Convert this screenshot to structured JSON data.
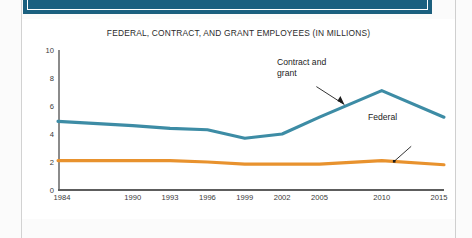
{
  "page": {
    "banner_color": "#1a6080",
    "sheet_color": "#fbfbfb"
  },
  "chart_data": {
    "type": "line",
    "title": "FEDERAL, CONTRACT, AND GRANT EMPLOYEES (IN MILLIONS)",
    "xlabel": "",
    "ylabel": "",
    "ylim": [
      0,
      10
    ],
    "yticks": [
      0,
      2,
      4,
      6,
      8,
      10
    ],
    "ytick_labels": [
      "0",
      "2",
      "4",
      "6",
      "8",
      "10"
    ],
    "x": [
      1984,
      1990,
      1993,
      1996,
      1999,
      2002,
      2005,
      2010,
      2015
    ],
    "xtick_labels": [
      "1984",
      "1990",
      "1993",
      "1996",
      "1999",
      "2002",
      "2005",
      "2010",
      "2015"
    ],
    "xlim": [
      1984,
      2015
    ],
    "grid": false,
    "legend_position": "inline-annotations",
    "series": [
      {
        "name": "Contract and grant",
        "color": "#3d8ca5",
        "values": [
          4.9,
          4.6,
          4.4,
          4.3,
          3.7,
          4.0,
          5.2,
          7.1,
          5.2
        ]
      },
      {
        "name": "Federal",
        "color": "#e8922e",
        "values": [
          2.1,
          2.1,
          2.1,
          2.0,
          1.85,
          1.85,
          1.85,
          2.1,
          1.8
        ]
      }
    ],
    "annotations": [
      {
        "label_line1": "Contract and",
        "label_line2": "grant",
        "target_year": 2007,
        "target_value": 6.1
      },
      {
        "label_line1": "Federal",
        "label_line2": "",
        "target_year": 2011,
        "target_value": 2.05
      }
    ]
  }
}
